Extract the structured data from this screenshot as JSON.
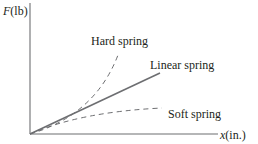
{
  "diagram": {
    "y_axis_label": {
      "var": "F",
      "unit": "(lb)"
    },
    "x_axis_label": {
      "var": "x",
      "unit": "(in.)"
    },
    "curves": [
      {
        "name": "Hard spring",
        "style": "dashed",
        "color": "#6d6e71"
      },
      {
        "name": "Linear spring",
        "style": "solid",
        "color": "#6d6e71"
      },
      {
        "name": "Soft spring",
        "style": "dashed",
        "color": "#6d6e71"
      }
    ],
    "axis_color": "#6d6e71"
  }
}
